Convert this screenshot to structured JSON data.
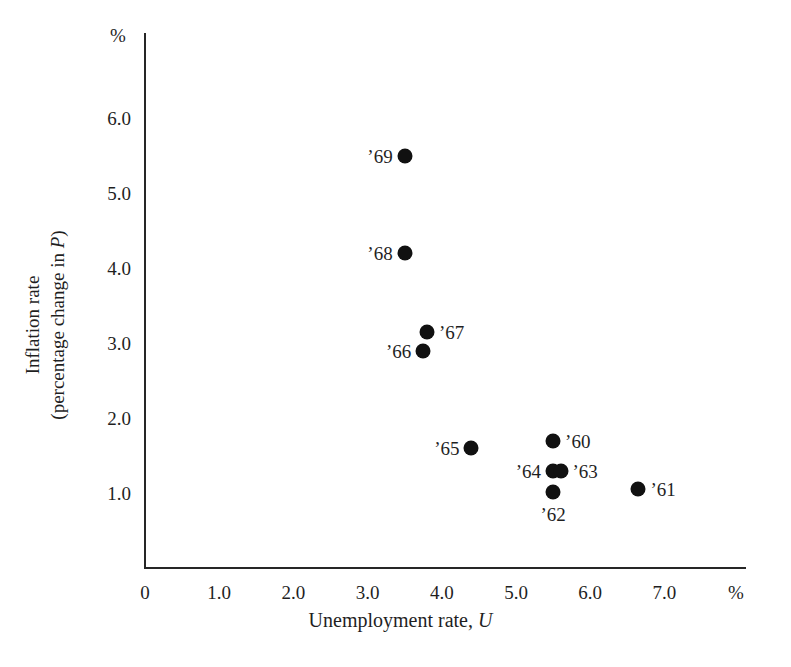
{
  "chart_data": {
    "type": "scatter",
    "title": "",
    "xlabel": "Unemployment rate, U",
    "ylabel": "Inflation rate (percentage change in P)",
    "ylabel_line1": "Inflation rate",
    "ylabel_line2_pre": "(percentage change in ",
    "ylabel_line2_italic": "P",
    "ylabel_line2_post": ")",
    "xlabel_pre": "Unemployment rate, ",
    "xlabel_italic": "U",
    "x_unit": "%",
    "y_unit": "%",
    "xlim": [
      0,
      7.5
    ],
    "ylim": [
      0,
      6.7
    ],
    "grid": false,
    "legend": "none",
    "xticks": [
      "0",
      "1.0",
      "2.0",
      "3.0",
      "4.0",
      "5.0",
      "6.0",
      "7.0"
    ],
    "xtick_values": [
      0,
      1,
      2,
      3,
      4,
      5,
      6,
      7
    ],
    "yticks": [
      "1.0",
      "2.0",
      "3.0",
      "4.0",
      "5.0",
      "6.0"
    ],
    "ytick_values": [
      1,
      2,
      3,
      4,
      5,
      6
    ],
    "marker": "filled-circle",
    "marker_color": "#111111",
    "points": [
      {
        "label": "’69",
        "x": 3.5,
        "y": 5.5,
        "label_pos": "left"
      },
      {
        "label": "’68",
        "x": 3.5,
        "y": 4.2,
        "label_pos": "left"
      },
      {
        "label": "’67",
        "x": 3.8,
        "y": 3.15,
        "label_pos": "right"
      },
      {
        "label": "’66",
        "x": 3.75,
        "y": 2.9,
        "label_pos": "left"
      },
      {
        "label": "’65",
        "x": 4.4,
        "y": 1.6,
        "label_pos": "left"
      },
      {
        "label": "’60",
        "x": 5.5,
        "y": 1.7,
        "label_pos": "right"
      },
      {
        "label": "’64",
        "x": 5.5,
        "y": 1.3,
        "label_pos": "left"
      },
      {
        "label": "’63",
        "x": 5.6,
        "y": 1.3,
        "label_pos": "right"
      },
      {
        "label": "’62",
        "x": 5.5,
        "y": 1.02,
        "label_pos": "below"
      },
      {
        "label": "’61",
        "x": 6.65,
        "y": 1.05,
        "label_pos": "right"
      }
    ]
  },
  "geometry": {
    "origin_x": 145,
    "origin_y": 568,
    "px_per_x_unit": 74.2,
    "px_per_y_unit": 75.0
  }
}
